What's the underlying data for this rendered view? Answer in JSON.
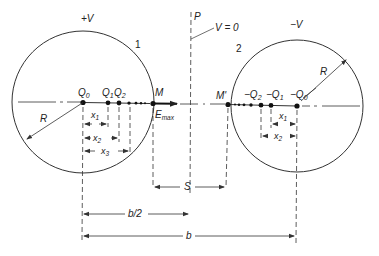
{
  "diagram": {
    "sphere1": {
      "number_label": "1",
      "potential_label": "+V",
      "radius_label": "R",
      "charges": [
        {
          "label": "Q",
          "sub": "0"
        },
        {
          "label": "Q",
          "sub": "1"
        },
        {
          "label": "Q",
          "sub": "2"
        }
      ],
      "distances": [
        {
          "label": "x",
          "sub": "1"
        },
        {
          "label": "x",
          "sub": "2"
        },
        {
          "label": "x",
          "sub": "3"
        }
      ],
      "surface_point": "M",
      "field_label": "E",
      "field_sub": "max"
    },
    "sphere2": {
      "number_label": "2",
      "potential_label": "−V",
      "radius_label": "R",
      "charges": [
        {
          "label": "−Q",
          "sub": "2"
        },
        {
          "label": "−Q",
          "sub": "1"
        },
        {
          "label": "−Q",
          "sub": "0"
        }
      ],
      "distances": [
        {
          "label": "x",
          "sub": "1"
        },
        {
          "label": "x",
          "sub": "2"
        }
      ],
      "surface_point": "M'"
    },
    "plane": {
      "label": "P",
      "potential_label": "V = 0"
    },
    "dimensions": {
      "gap": "S",
      "half_separation": "b/2",
      "separation": "b"
    },
    "colors": {
      "line": "#333333",
      "background": "#ffffff"
    }
  }
}
